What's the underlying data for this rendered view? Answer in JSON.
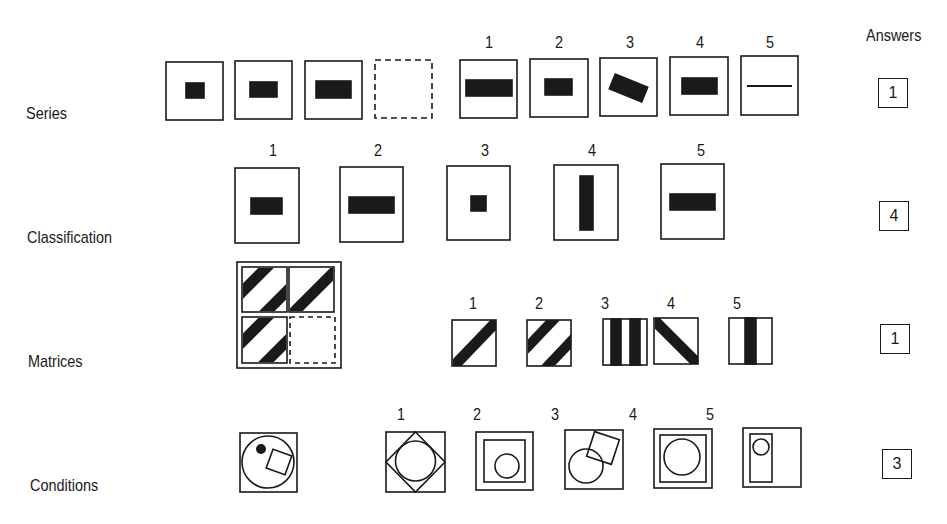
{
  "header": {
    "answers_label": "Answers"
  },
  "rows": [
    {
      "label": "Series",
      "option_numbers": [
        "1",
        "2",
        "3",
        "4",
        "5"
      ],
      "answer": "1"
    },
    {
      "label": "Classification",
      "option_numbers": [
        "1",
        "2",
        "3",
        "4",
        "5"
      ],
      "answer": "4"
    },
    {
      "label": "Matrices",
      "option_numbers": [
        "1",
        "2",
        "3",
        "4",
        "5"
      ],
      "answer": "1"
    },
    {
      "label": "Conditions",
      "option_numbers": [
        "1",
        "2",
        "3",
        "4",
        "5"
      ],
      "answer": "3"
    }
  ],
  "colors": {
    "ink": "#1a1a1a",
    "background": "#ffffff"
  }
}
